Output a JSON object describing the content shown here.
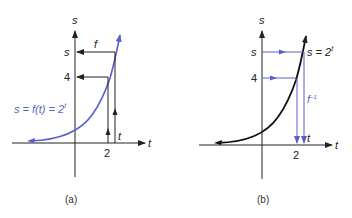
{
  "colors": {
    "curve_a": "#5a5fc8",
    "curve_b": "#111111",
    "arrow_blue": "#5a5fc8",
    "axis": "#222222"
  },
  "panel_a": {
    "caption": "(a)",
    "y_axis_label": "s",
    "x_axis_label": "t",
    "tick_s": "s",
    "tick_4": "4",
    "tick_2": "2",
    "tick_t": "t",
    "arrow_label": "f",
    "curve_label": "s = f(t) = 2",
    "curve_label_exp": "t"
  },
  "panel_b": {
    "caption": "(b)",
    "y_axis_label": "s",
    "x_axis_label": "t",
    "tick_s": "s",
    "tick_4": "4",
    "tick_2": "2",
    "tick_t": "t",
    "arrow_label": "f",
    "arrow_label_exp": "−1",
    "curve_label": "s = 2",
    "curve_label_exp": "t"
  }
}
